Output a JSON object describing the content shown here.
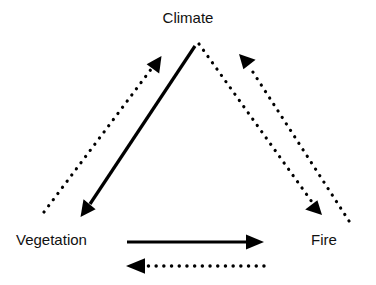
{
  "diagram": {
    "type": "feedback-loop-triangle",
    "background_color": "#ffffff",
    "stroke_color": "#000000",
    "nodes": [
      {
        "id": "climate",
        "label": "Climate",
        "position": "top-center"
      },
      {
        "id": "vegetation",
        "label": "Vegetation",
        "position": "bottom-left"
      },
      {
        "id": "fire",
        "label": "Fire",
        "position": "bottom-right"
      }
    ],
    "edges": [
      {
        "id": "vegetation-to-climate",
        "from": "Vegetation",
        "to": "Climate",
        "style": "dotted",
        "direction": "up-right",
        "side": "left"
      },
      {
        "id": "climate-to-vegetation",
        "from": "Climate",
        "to": "Vegetation",
        "style": "solid",
        "direction": "down-left",
        "side": "left"
      },
      {
        "id": "fire-to-climate",
        "from": "Fire",
        "to": "Climate",
        "style": "dotted",
        "direction": "up-left",
        "side": "right"
      },
      {
        "id": "climate-to-fire",
        "from": "Climate",
        "to": "Fire",
        "style": "dotted",
        "direction": "down-right",
        "side": "right"
      },
      {
        "id": "vegetation-to-fire",
        "from": "Vegetation",
        "to": "Fire",
        "style": "solid",
        "direction": "right",
        "side": "bottom"
      },
      {
        "id": "fire-to-vegetation",
        "from": "Fire",
        "to": "Vegetation",
        "style": "dotted",
        "direction": "left",
        "side": "bottom"
      }
    ]
  }
}
